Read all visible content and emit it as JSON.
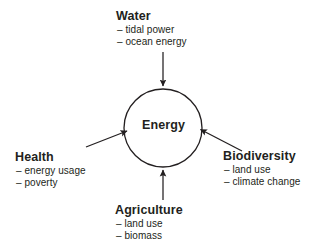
{
  "diagram": {
    "background_color": "#ffffff",
    "stroke_color": "#231f20",
    "center": {
      "label": "Energy",
      "shape": "circle",
      "cx": 163,
      "cy": 128,
      "r": 39
    },
    "nodes": [
      {
        "id": "water",
        "title": "Water",
        "sub_items": [
          "– tidal power",
          "– ocean energy"
        ],
        "position": "top",
        "arrow": "down"
      },
      {
        "id": "health",
        "title": "Health",
        "sub_items": [
          "– energy usage",
          "– poverty"
        ],
        "position": "left",
        "arrow": "up-right"
      },
      {
        "id": "biodiversity",
        "title": "Biodiversity",
        "sub_items": [
          "– land use",
          "– climate change"
        ],
        "position": "right",
        "arrow": "up-left"
      },
      {
        "id": "agriculture",
        "title": "Agriculture",
        "sub_items": [
          "– land use",
          "– biomass"
        ],
        "position": "bottom",
        "arrow": "up"
      }
    ],
    "arrows": [
      {
        "id": "water-to-energy",
        "from": [
          163,
          52
        ],
        "to": [
          163,
          86
        ],
        "direction": "down"
      },
      {
        "id": "agriculture-to-energy",
        "from": [
          163,
          200
        ],
        "to": [
          163,
          170
        ],
        "direction": "up"
      },
      {
        "id": "health-to-energy",
        "from": [
          86,
          147
        ],
        "to": [
          127,
          131
        ],
        "direction": "up-right"
      },
      {
        "id": "biodiversity-to-energy",
        "from": [
          242,
          151
        ],
        "to": [
          200,
          130
        ],
        "direction": "up-left"
      }
    ]
  }
}
